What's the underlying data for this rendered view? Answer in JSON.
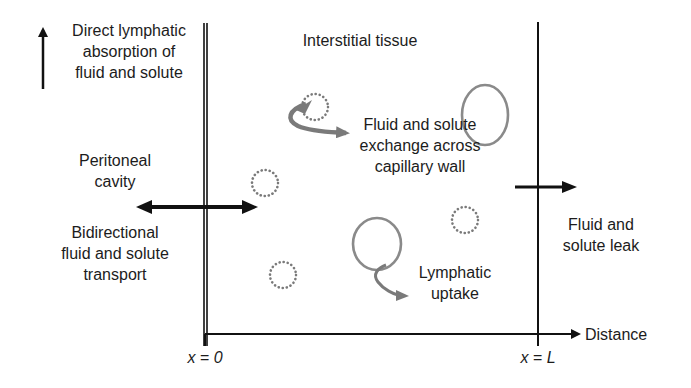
{
  "diagram": {
    "labels": {
      "direct_lymphatic": [
        "Direct lymphatic",
        "absorption of",
        "fluid and solute"
      ],
      "interstitial": "Interstitial tissue",
      "exchange": [
        "Fluid and solute",
        "exchange across",
        "capillary wall"
      ],
      "peritoneal": [
        "Peritoneal",
        "cavity"
      ],
      "bidirectional": [
        "Bidirectional",
        "fluid and solute",
        "transport"
      ],
      "leak": [
        "Fluid and",
        "solute leak"
      ],
      "lymphatic_uptake": [
        "Lymphatic",
        "uptake"
      ],
      "axis_label": "Distance",
      "x0": "x = 0",
      "xL": "x = L"
    },
    "colors": {
      "line": "#111111",
      "gray_arrow": "#7a7a7a",
      "dotted": "#7a7a7a",
      "capillary": "#8a8a8a"
    }
  }
}
